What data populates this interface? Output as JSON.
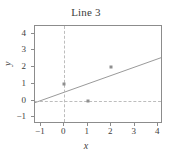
{
  "chart_data": {
    "type": "scatter",
    "title": "Line 3",
    "xlabel": "x",
    "ylabel": "y",
    "xlim": [
      -1.25,
      4.2
    ],
    "ylim": [
      -1.4,
      4.45
    ],
    "xticks": [
      "-1",
      "0",
      "1",
      "2",
      "3",
      "4"
    ],
    "xtick_values": [
      -1,
      0,
      1,
      2,
      3,
      4
    ],
    "yticks": [
      "4",
      "3",
      "2",
      "1",
      "0",
      "-1"
    ],
    "ytick_values": [
      4,
      3,
      2,
      1,
      0,
      -1
    ],
    "grid": false,
    "legend": false,
    "points": [
      {
        "x": 0,
        "y": 1
      },
      {
        "x": 1,
        "y": 0
      },
      {
        "x": 2,
        "y": 2
      }
    ],
    "series": [
      {
        "name": "points",
        "marker": "square",
        "color": "#8f8f8f",
        "x": [
          0,
          1,
          2
        ],
        "values": [
          1,
          0,
          2
        ]
      },
      {
        "name": "fit-line",
        "type": "line",
        "color": "#9a9a9a",
        "slope": 0.5,
        "intercept": 0.5,
        "x_start": -1.25,
        "y_start": -0.125,
        "x_end": 4.2,
        "y_end": 2.6
      }
    ],
    "reference_lines": [
      {
        "orientation": "vertical",
        "value": 0,
        "style": "dashed",
        "color": "#bdbdbd"
      },
      {
        "orientation": "horizontal",
        "value": 0,
        "style": "dashed",
        "color": "#bdbdbd"
      }
    ],
    "frame_color": "#8c8c8c",
    "text_color": "#3d3d3d"
  }
}
